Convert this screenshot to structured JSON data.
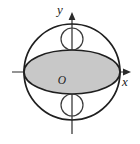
{
  "figure": {
    "name": "circle-with-inscribed-shaded-ellipse-and-two-small-circles",
    "width": 140,
    "height": 144,
    "background_color": "#ffffff"
  },
  "axes": {
    "origin_label": "O",
    "x_label": "x",
    "y_label": "y",
    "axis_color": "#2b2b2b",
    "origin": {
      "x": 72,
      "y": 72
    },
    "x_axis": {
      "x_start": 12,
      "x_end": 131,
      "y": 72,
      "arrow": "right"
    },
    "y_axis": {
      "y_start": 12,
      "y_end": 134,
      "x": 72,
      "arrow": "up"
    },
    "origin_label_pos": {
      "x": 62,
      "y": 84
    },
    "x_label_pos": {
      "x": 125,
      "y": 84
    },
    "y_label_pos": {
      "x": 60,
      "y": 14
    }
  },
  "shapes": {
    "big_circle": {
      "label": "large-circle",
      "cx": 72,
      "cy": 72,
      "r": 48,
      "fill": "none",
      "stroke": "#1f1f1f",
      "stroke_width": 1.7
    },
    "ellipse": {
      "label": "shaded-ellipse",
      "cx": 72,
      "cy": 72,
      "rx": 48,
      "ry": 22,
      "fill": "#c8c8c8",
      "stroke": "#1f1f1f",
      "stroke_width": 1.7
    },
    "small_circles": [
      {
        "label": "upper-small-circle",
        "cx": 72,
        "cy": 39,
        "r": 11,
        "fill": "none",
        "stroke": "#3a3a3a",
        "stroke_width": 1.2
      },
      {
        "label": "lower-small-circle",
        "cx": 72,
        "cy": 105,
        "r": 11,
        "fill": "none",
        "stroke": "#3a3a3a",
        "stroke_width": 1.2
      }
    ]
  }
}
